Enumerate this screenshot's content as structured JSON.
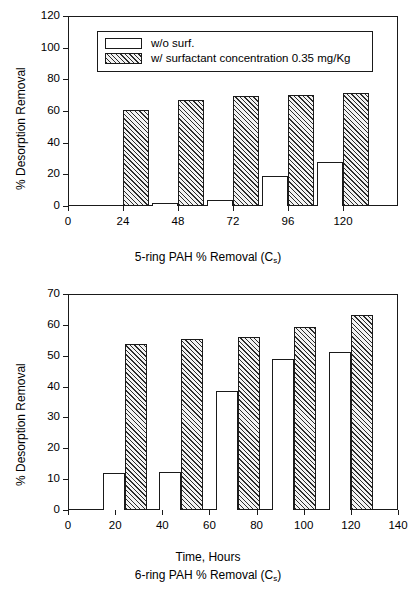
{
  "figure": {
    "background": "#ffffff",
    "ink": "#1a1a1a"
  },
  "legend": {
    "position": "top-left-inside",
    "entries": [
      {
        "label": "w/o surf.",
        "style": "plain-white"
      },
      {
        "label": "w/ surfactant concentration 0.35 mg/Kg",
        "style": "diagonal-hatch"
      }
    ]
  },
  "chart_data": [
    {
      "id": "top-panel",
      "type": "bar",
      "title": "",
      "xlabel": "5-ring PAH % Removal (C",
      "xlabel_sub": "s",
      "xlabel_tail": ")",
      "ylabel": "% Desorption Removal",
      "x": [
        24,
        48,
        72,
        96,
        120
      ],
      "xtick_labels": [
        "0",
        "24",
        "48",
        "72",
        "96",
        "120"
      ],
      "xticks": [
        0,
        24,
        48,
        72,
        96,
        120
      ],
      "xlim": [
        0,
        144
      ],
      "ytick_labels": [
        "0",
        "20",
        "40",
        "60",
        "80",
        "100",
        "120"
      ],
      "yticks": [
        0,
        20,
        40,
        60,
        80,
        100,
        120
      ],
      "ylim": [
        0,
        120
      ],
      "grid": false,
      "series": [
        {
          "name": "w/o surf.",
          "style": "plain-white",
          "values": [
            0.8,
            2.2,
            3.8,
            19.0,
            27.6
          ]
        },
        {
          "name": "w/ surfactant concentration 0.35 mg/Kg",
          "style": "diagonal-hatch",
          "values": [
            60.5,
            67.0,
            69.5,
            70.3,
            71.4
          ]
        }
      ]
    },
    {
      "id": "bottom-panel",
      "type": "bar",
      "title": "",
      "xlabel": "Time, Hours",
      "ylabel": "% Desorption Removal",
      "caption": "6-ring PAH % Removal (C",
      "caption_sub": "s",
      "caption_tail": ")",
      "x": [
        24,
        48,
        72,
        96,
        120
      ],
      "xtick_labels": [
        "0",
        "20",
        "40",
        "60",
        "80",
        "100",
        "120",
        "140"
      ],
      "xticks": [
        0,
        20,
        40,
        60,
        80,
        100,
        120,
        140
      ],
      "xlim": [
        0,
        140
      ],
      "ytick_labels": [
        "0",
        "10",
        "20",
        "30",
        "40",
        "50",
        "60",
        "70"
      ],
      "yticks": [
        0,
        10,
        20,
        30,
        40,
        50,
        60,
        70
      ],
      "ylim": [
        0,
        70
      ],
      "grid": false,
      "series": [
        {
          "name": "w/o surf.",
          "style": "plain-white",
          "values": [
            12.1,
            12.2,
            38.6,
            49.0,
            51.1
          ]
        },
        {
          "name": "w/ surfactant concentration 0.35 mg/Kg",
          "style": "diagonal-hatch",
          "values": [
            53.8,
            55.3,
            56.2,
            59.2,
            63.2
          ]
        }
      ]
    }
  ]
}
